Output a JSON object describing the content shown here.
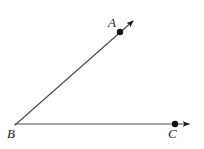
{
  "figure": {
    "background_color": "#ffffff",
    "stroke_color": "#3a3a3a",
    "point_color": "#000000",
    "label_color": "#1a1a1a",
    "width": 204,
    "height": 149
  },
  "labels": {
    "a": "A",
    "b": "B",
    "c": "C"
  },
  "points": [
    {
      "name": "A",
      "x": 120,
      "y": 32,
      "radius": 3.2,
      "label": "A",
      "label_position": "above-left"
    },
    {
      "name": "B",
      "x": 15,
      "y": 125,
      "radius": 0,
      "label": "B",
      "label_position": "below-left"
    },
    {
      "name": "C",
      "x": 175,
      "y": 124,
      "radius": 3.2,
      "label": "C",
      "label_position": "below"
    }
  ],
  "rays": [
    {
      "name": "ray-BA",
      "from": "B",
      "through": "A",
      "start": {
        "x": 15,
        "y": 125
      },
      "end": {
        "x": 136,
        "y": 18
      },
      "arrowhead": true,
      "stroke_width": 1.1
    },
    {
      "name": "ray-BC",
      "from": "B",
      "through": "C",
      "start": {
        "x": 15,
        "y": 124
      },
      "end": {
        "x": 193,
        "y": 124
      },
      "arrowhead": true,
      "stroke_width": 1.1
    }
  ]
}
